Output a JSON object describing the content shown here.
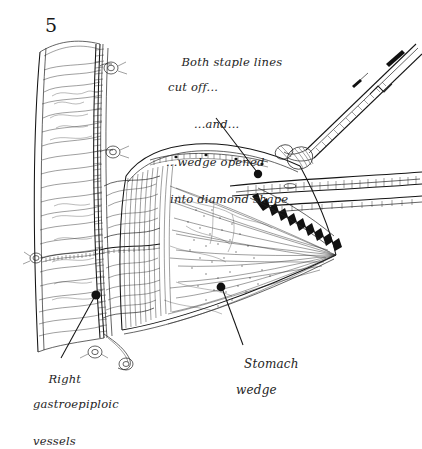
{
  "figure": {
    "number": "5",
    "kind": "surgical pen-and-ink illustration",
    "medium_colors": {
      "background": "#ffffff",
      "ink": "#1b1b1b",
      "hatching": "#2a2a2a",
      "label_text": "#242424"
    }
  },
  "annotations": {
    "staple_note": {
      "line1": "Both staple lines",
      "line2": "cut off...",
      "line3": "...and...",
      "line4": "...wedge opened",
      "line5": "into diamond shape",
      "leader": "line-with-dot-to-opened-wedge-apex"
    },
    "vessels_label": {
      "line1": "Right",
      "line2": "gastroepiploic",
      "line3": "vessels",
      "leader": "line-with-dot-to-vessel-arcade"
    },
    "wedge_label": {
      "line1": "Stomach",
      "line2": "wedge",
      "leader": "line-with-dot-to-wedge-body"
    }
  },
  "anatomy": {
    "structures": [
      "gastric tube / lesser curve staple line (left vertical)",
      "stomach wedge (central fan-shaped specimen)",
      "right gastroepiploic vascular arcade",
      "greater curve omental attachments",
      "divided staple lines"
    ],
    "instruments": [
      "long curved clamp (upper right, diagonal)",
      "second clamp / retractor (right horizontal)",
      "tissue forceps grasping wedge apex"
    ],
    "vessel_ties_count": 4
  }
}
